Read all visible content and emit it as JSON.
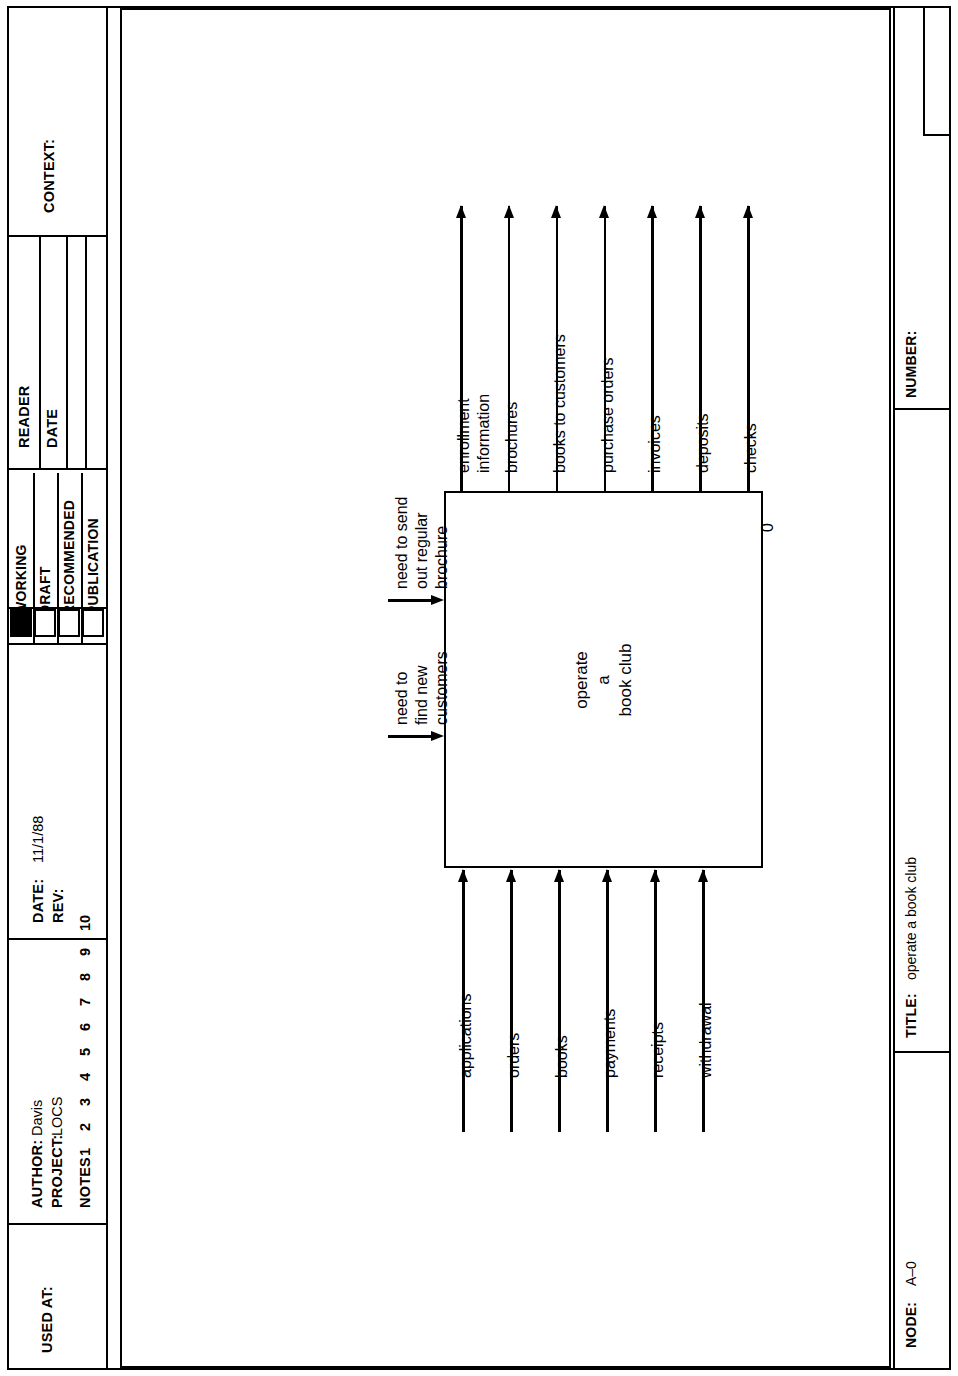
{
  "form": {
    "used_at": {
      "label": "USED AT:",
      "value": ""
    },
    "author": {
      "label": "AUTHOR:",
      "value": "Davis"
    },
    "project": {
      "label": "PROJECT:",
      "value": "LOCS"
    },
    "notes": {
      "label": "NOTES",
      "numbers": [
        "1",
        "2",
        "3",
        "4",
        "5",
        "6",
        "7",
        "8",
        "9",
        "10"
      ]
    },
    "date": {
      "label": "DATE:",
      "value": "11/1/88"
    },
    "rev": {
      "label": "REV:",
      "value": ""
    },
    "status": {
      "items": [
        {
          "label": "WORKING",
          "checked": true
        },
        {
          "label": "DRAFT",
          "checked": false
        },
        {
          "label": "RECOMMENDED",
          "checked": false
        },
        {
          "label": "PUBLICATION",
          "checked": false
        }
      ]
    },
    "reader": {
      "label": "READER"
    },
    "reader_date": {
      "label": "DATE"
    },
    "context": {
      "label": "CONTEXT:",
      "value": ""
    },
    "node": {
      "label": "NODE:",
      "value": "A–0"
    },
    "title": {
      "label": "TITLE:",
      "value": "operate a book club"
    },
    "number": {
      "label": "NUMBER:",
      "value": ""
    }
  },
  "diagram": {
    "type": "idef0-context-diagram",
    "activity": {
      "name_lines": [
        "operate",
        "a",
        "book club"
      ],
      "name": "operate a book club",
      "number": "0"
    },
    "inputs": [
      {
        "label": "applications"
      },
      {
        "label": "orders"
      },
      {
        "label": "books"
      },
      {
        "label": "payments"
      },
      {
        "label": "receipts"
      },
      {
        "label": "withdrawal"
      }
    ],
    "outputs": [
      {
        "label": "enrollment\ninformation"
      },
      {
        "label": "brochures"
      },
      {
        "label": "books to customers"
      },
      {
        "label": "purchase orders"
      },
      {
        "label": "invoices"
      },
      {
        "label": "deposits"
      },
      {
        "label": "checks"
      }
    ],
    "controls": [
      {
        "label": "need to send\nout regular\nbrochure"
      },
      {
        "label": "need to\nfind new\ncustomers"
      }
    ]
  },
  "colors": {
    "ink": "#000000",
    "paper": "#ffffff"
  }
}
